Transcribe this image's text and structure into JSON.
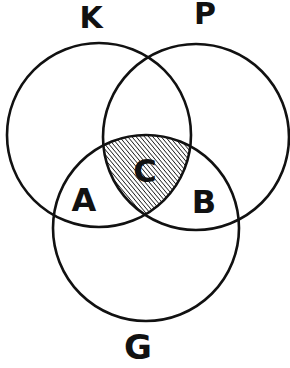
{
  "diagram": {
    "type": "venn",
    "sets": [
      {
        "id": "K",
        "label": "K"
      },
      {
        "id": "P",
        "label": "P"
      },
      {
        "id": "G",
        "label": "G"
      }
    ],
    "regions": [
      {
        "id": "A",
        "label": "A",
        "membership": [
          "K",
          "G"
        ],
        "shaded": false
      },
      {
        "id": "B",
        "label": "B",
        "membership": [
          "P",
          "G"
        ],
        "shaded": false
      },
      {
        "id": "C",
        "label": "C",
        "membership": [
          "K",
          "P",
          "G"
        ],
        "shaded": true,
        "fill_style": "diagonal-hatch"
      }
    ],
    "colors": {
      "stroke": "#111111",
      "background": "#ffffff",
      "hatch": "#111111"
    }
  }
}
